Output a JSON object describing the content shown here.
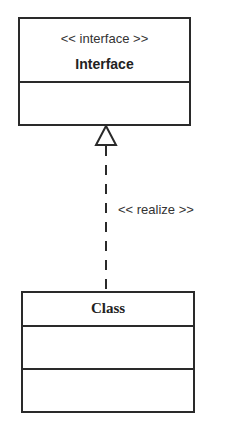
{
  "diagram": {
    "type": "UML class diagram - interface realization",
    "interface": {
      "stereotype": "<< interface >>",
      "name": "Interface",
      "attributes": [],
      "operations": []
    },
    "class": {
      "name": "Class",
      "attributes": [],
      "operations": []
    },
    "relationship": {
      "type": "realization",
      "label": "<< realize >>",
      "from": "Class",
      "to": "Interface",
      "line_style": "dashed",
      "arrowhead": "hollow-triangle"
    },
    "colors": {
      "stroke": "#2a2a2a",
      "text": "#333333",
      "background": "#ffffff"
    }
  }
}
